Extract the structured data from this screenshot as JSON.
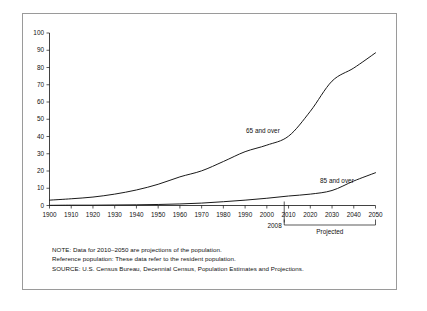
{
  "chart_data": {
    "type": "line",
    "title": "",
    "xlabel": "",
    "ylabel": "",
    "xlim": [
      1900,
      2050
    ],
    "ylim": [
      0,
      100
    ],
    "grid": false,
    "legend_position": "inline-annotation",
    "x": [
      1900,
      1910,
      1920,
      1930,
      1940,
      1950,
      1960,
      1970,
      1980,
      1990,
      2000,
      2010,
      2020,
      2030,
      2040,
      2050
    ],
    "xticks": [
      "1900",
      "1910",
      "1920",
      "1930",
      "1940",
      "1950",
      "1960",
      "1970",
      "1980",
      "1990",
      "2000",
      "2010",
      "2020",
      "2030",
      "2040",
      "2050"
    ],
    "yticks": [
      "0",
      "10",
      "20",
      "30",
      "40",
      "50",
      "60",
      "70",
      "80",
      "90",
      "100"
    ],
    "series": [
      {
        "name": "65 and over",
        "values": [
          3.1,
          3.9,
          4.9,
          6.6,
          9.0,
          12.3,
          16.6,
          20.1,
          25.5,
          31.2,
          35.0,
          40.2,
          54.6,
          72.1,
          79.7,
          88.5
        ]
      },
      {
        "name": "85 and over",
        "values": [
          0.1,
          0.2,
          0.2,
          0.3,
          0.4,
          0.6,
          0.9,
          1.4,
          2.2,
          3.1,
          4.2,
          5.5,
          6.6,
          8.7,
          14.2,
          19.0
        ]
      }
    ],
    "annotations": [
      {
        "name": "marker-2008",
        "text": "2008",
        "x": 2008
      },
      {
        "name": "projected-bracket",
        "text": "Projected",
        "x_start": 2008,
        "x_end": 2050
      }
    ]
  },
  "notes": {
    "line1": "NOTE: Data for 2010–2050 are projections of the population.",
    "line2": "Reference population: These data refer to the resident population.",
    "line3": "SOURCE: U.S. Census Bureau, Decennial Census, Population Estimates and Projections."
  },
  "colors": {
    "curve": "#1a1a1a",
    "axis": "#111111",
    "frame": "#9a9a9a",
    "background": "#ffffff"
  }
}
